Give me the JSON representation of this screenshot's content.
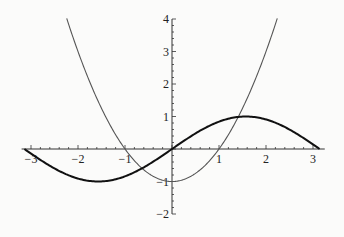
{
  "chart_data": {
    "type": "line",
    "title": "",
    "xlabel": "",
    "ylabel": "",
    "xlim": [
      -3.2,
      3.25
    ],
    "ylim": [
      -2,
      4
    ],
    "grid": false,
    "legend": null,
    "x_ticks": [
      -3,
      -2,
      -1,
      1,
      2,
      3
    ],
    "x_tick_labels": [
      "−3",
      "−2",
      "−1",
      "1",
      "2",
      "3"
    ],
    "y_ticks": [
      -2,
      -1,
      1,
      2,
      3,
      4
    ],
    "y_tick_labels": [
      "−2",
      "−1",
      "1",
      "2",
      "3",
      "4"
    ],
    "series": [
      {
        "name": "sin(x)",
        "style": "thick",
        "color": "#111111",
        "x": [
          -3.14,
          -2.5,
          -2,
          -1.57,
          -1,
          -0.5,
          0,
          0.5,
          1,
          1.57,
          2,
          2.5,
          3.14
        ],
        "y": [
          0,
          -0.6,
          -0.91,
          -1,
          -0.84,
          -0.48,
          0,
          0.48,
          0.84,
          1,
          0.91,
          0.6,
          0
        ]
      },
      {
        "name": "x^2 - 1",
        "style": "thin",
        "color": "#555555",
        "x": [
          -2.24,
          -2,
          -1.5,
          -1,
          -0.5,
          0,
          0.5,
          1,
          1.5,
          2,
          2.24
        ],
        "y": [
          4,
          3,
          1.25,
          0,
          -0.75,
          -1,
          -0.75,
          0,
          1.25,
          3,
          4
        ]
      }
    ]
  }
}
